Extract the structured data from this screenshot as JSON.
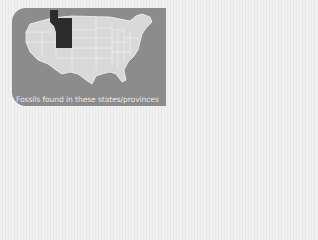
{
  "map": {
    "region": "United States (contiguous) and southern Canada",
    "highlighted_areas": [
      "Alberta (southern)",
      "Montana",
      "Wyoming"
    ],
    "colors": {
      "card_background": "#8c8c8c",
      "land": "#d9d9d9",
      "borders": "#f4f4f4",
      "highlight": "#2b2b2b",
      "caption_text": "#e6e6e6"
    }
  },
  "caption": "Fossils found in these states/provinces"
}
